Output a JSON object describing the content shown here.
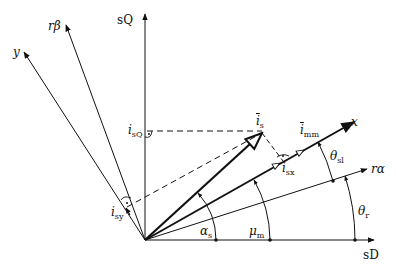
{
  "diagram": {
    "type": "space-vector phasor diagram",
    "axes": {
      "sD": "sD",
      "sQ": "sQ",
      "r_alpha": "rα",
      "r_beta": "rβ",
      "x": "x",
      "y": "y"
    },
    "vectors": {
      "stator_current": {
        "symbol": "i",
        "sub": "s"
      },
      "magnetizing_current": {
        "symbol": "i",
        "sub": "mm"
      }
    },
    "components": {
      "isQ": {
        "symbol": "i",
        "sub": "sQ"
      },
      "isx": {
        "symbol": "i",
        "sub": "sx"
      },
      "isy": {
        "symbol": "i",
        "sub": "sy"
      }
    },
    "angles": {
      "alpha_s": {
        "symbol": "α",
        "sub": "s"
      },
      "mu_m": {
        "symbol": "μ",
        "sub": "m"
      },
      "theta_r": {
        "symbol": "θ",
        "sub": "r"
      },
      "theta_sl": {
        "symbol": "θ",
        "sub": "sl"
      }
    },
    "colors": {
      "line": "#111111",
      "background": "#ffffff"
    }
  }
}
